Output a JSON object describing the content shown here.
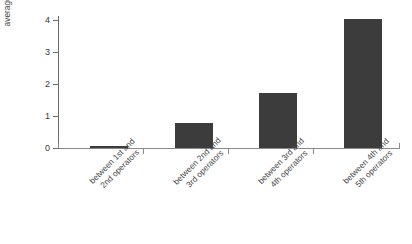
{
  "chart_data": {
    "type": "bar",
    "title": "",
    "xlabel": "",
    "ylabel": "average annual increase in subscription",
    "categories": [
      "between 1st and 2nd operators",
      "between 2nd and 3rd operators",
      "between 3rd and 4th operators",
      "between 4th and 5th operators"
    ],
    "values": [
      0.06,
      0.77,
      1.73,
      4.03
    ],
    "ylim": [
      0,
      4.1
    ],
    "yticks": [
      0,
      1,
      2,
      3,
      4
    ],
    "ytick_labels": [
      "0",
      "1",
      "2",
      "3",
      "4"
    ],
    "grid": false,
    "legend": false,
    "bar_color": "#3c3c3c",
    "axis_color": "#8a8a8a"
  },
  "axis": {
    "y_title_line1": "average annual increase in",
    "y_title_line2": "subscription",
    "y_labels": {
      "t0": "0",
      "t1": "1",
      "t2": "2",
      "t3": "3",
      "t4": "4"
    }
  },
  "categories": {
    "c0_line1": "between 1st and",
    "c0_line2": "2nd operators",
    "c1_line1": "between 2nd and",
    "c1_line2": "3rd operators",
    "c2_line1": "between 3rd and",
    "c2_line2": "4th operators",
    "c3_line1": "between 4th and",
    "c3_line2": "5th operators"
  }
}
